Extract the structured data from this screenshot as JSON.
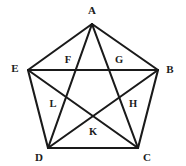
{
  "figure": {
    "type": "geometry-diagram",
    "canvas": {
      "width": 186,
      "height": 166
    },
    "background_color": "#ffffff",
    "line_color": "#1a1a1a",
    "label_color": "#1c1c1c",
    "line_width": 2.1
  },
  "outer_vertices": [
    {
      "id": "A",
      "label": "A",
      "x": 92,
      "y": 24,
      "label_x": 92,
      "label_y": 10
    },
    {
      "id": "B",
      "label": "B",
      "x": 158,
      "y": 70,
      "label_x": 170,
      "label_y": 69
    },
    {
      "id": "C",
      "label": "C",
      "x": 138,
      "y": 148,
      "label_x": 147,
      "label_y": 157
    },
    {
      "id": "D",
      "label": "D",
      "x": 48,
      "y": 148,
      "label_x": 39,
      "label_y": 157
    },
    {
      "id": "E",
      "label": "E",
      "x": 28,
      "y": 70,
      "label_x": 15,
      "label_y": 68
    }
  ],
  "inner_vertices": [
    {
      "id": "F",
      "label": "F",
      "x": 75,
      "y": 70,
      "label_x": 68,
      "label_y": 59
    },
    {
      "id": "G",
      "label": "G",
      "x": 111,
      "y": 70,
      "label_x": 119,
      "label_y": 59
    },
    {
      "id": "H",
      "label": "H",
      "x": 122,
      "y": 104,
      "label_x": 133,
      "label_y": 103
    },
    {
      "id": "K",
      "label": "K",
      "x": 93,
      "y": 125,
      "label_x": 93,
      "label_y": 131
    },
    {
      "id": "L",
      "label": "L",
      "x": 64,
      "y": 104,
      "label_x": 53,
      "label_y": 103
    }
  ],
  "sides": [
    {
      "name": "side-AB",
      "from": "A",
      "to": "B",
      "x1": 92,
      "y1": 24,
      "x2": 158,
      "y2": 70
    },
    {
      "name": "side-BC",
      "from": "B",
      "to": "C",
      "x1": 158,
      "y1": 70,
      "x2": 138,
      "y2": 148
    },
    {
      "name": "side-CD",
      "from": "C",
      "to": "D",
      "x1": 138,
      "y1": 148,
      "x2": 48,
      "y2": 148
    },
    {
      "name": "side-DE",
      "from": "D",
      "to": "E",
      "x1": 48,
      "y1": 148,
      "x2": 28,
      "y2": 70
    },
    {
      "name": "side-EA",
      "from": "E",
      "to": "A",
      "x1": 28,
      "y1": 70,
      "x2": 92,
      "y2": 24
    }
  ],
  "diagonals": [
    {
      "name": "diagonal-AC",
      "from": "A",
      "to": "C",
      "x1": 92,
      "y1": 24,
      "x2": 138,
      "y2": 148
    },
    {
      "name": "diagonal-AD",
      "from": "A",
      "to": "D",
      "x1": 92,
      "y1": 24,
      "x2": 48,
      "y2": 148
    },
    {
      "name": "diagonal-BD",
      "from": "B",
      "to": "D",
      "x1": 158,
      "y1": 70,
      "x2": 48,
      "y2": 148
    },
    {
      "name": "diagonal-BE",
      "from": "B",
      "to": "E",
      "x1": 158,
      "y1": 70,
      "x2": 28,
      "y2": 70
    },
    {
      "name": "diagonal-CE",
      "from": "C",
      "to": "E",
      "x1": 138,
      "y1": 148,
      "x2": 28,
      "y2": 70
    }
  ]
}
